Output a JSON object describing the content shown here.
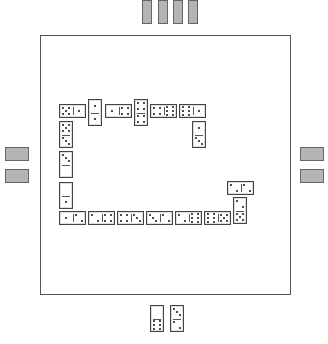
{
  "board": {
    "left": 40,
    "top": 35,
    "width": 251,
    "height": 260
  },
  "opponents": {
    "top": {
      "count": 4,
      "tiles": [
        {
          "x": 142,
          "y": 0
        },
        {
          "x": 158,
          "y": 0
        },
        {
          "x": 173,
          "y": 0
        },
        {
          "x": 188,
          "y": 0
        }
      ],
      "w": 10,
      "h": 24
    },
    "left": {
      "count": 2,
      "tiles": [
        {
          "x": 5,
          "y": 147
        },
        {
          "x": 5,
          "y": 169
        }
      ],
      "w": 24,
      "h": 14
    },
    "right": {
      "count": 2,
      "tiles": [
        {
          "x": 300,
          "y": 147
        },
        {
          "x": 300,
          "y": 169
        }
      ],
      "w": 24,
      "h": 14
    }
  },
  "colors": {
    "hidden_tile": "#b4b4b4",
    "border": "#555555",
    "pip": "#111111"
  },
  "chain": [
    {
      "x": 59,
      "y": 104,
      "w": 27,
      "h": 14,
      "o": "h",
      "a": 5,
      "b": 1
    },
    {
      "x": 88,
      "y": 99,
      "w": 14,
      "h": 27,
      "o": "v",
      "a": 1,
      "b": 1
    },
    {
      "x": 105,
      "y": 104,
      "w": 27,
      "h": 14,
      "o": "h",
      "a": 1,
      "b": 4
    },
    {
      "x": 134,
      "y": 99,
      "w": 14,
      "h": 27,
      "o": "v",
      "a": 4,
      "b": 4
    },
    {
      "x": 150,
      "y": 104,
      "w": 27,
      "h": 14,
      "o": "h",
      "a": 4,
      "b": 6
    },
    {
      "x": 179,
      "y": 104,
      "w": 27,
      "h": 14,
      "o": "h",
      "a": 6,
      "b": 1
    },
    {
      "x": 192,
      "y": 121,
      "w": 14,
      "h": 27,
      "o": "v",
      "a": 1,
      "b": 3
    },
    {
      "x": 59,
      "y": 121,
      "w": 14,
      "h": 27,
      "o": "v",
      "a": 5,
      "b": 3
    },
    {
      "x": 59,
      "y": 151,
      "w": 14,
      "h": 27,
      "o": "v",
      "a": 3,
      "b": 0
    },
    {
      "x": 59,
      "y": 182,
      "w": 14,
      "h": 27,
      "o": "v",
      "a": 0,
      "b": 1
    },
    {
      "x": 59,
      "y": 211,
      "w": 27,
      "h": 14,
      "o": "h",
      "a": 1,
      "b": 2
    },
    {
      "x": 88,
      "y": 211,
      "w": 27,
      "h": 14,
      "o": "h",
      "a": 2,
      "b": 4
    },
    {
      "x": 117,
      "y": 211,
      "w": 27,
      "h": 14,
      "o": "h",
      "a": 4,
      "b": 3
    },
    {
      "x": 146,
      "y": 211,
      "w": 27,
      "h": 14,
      "o": "h",
      "a": 3,
      "b": 2
    },
    {
      "x": 175,
      "y": 211,
      "w": 27,
      "h": 14,
      "o": "h",
      "a": 2,
      "b": 6
    },
    {
      "x": 204,
      "y": 211,
      "w": 27,
      "h": 14,
      "o": "h",
      "a": 6,
      "b": 5
    },
    {
      "x": 233,
      "y": 197,
      "w": 14,
      "h": 27,
      "o": "v",
      "a": 2,
      "b": 5
    },
    {
      "x": 227,
      "y": 181,
      "w": 27,
      "h": 14,
      "o": "h",
      "a": 2,
      "b": 2
    }
  ],
  "hand": [
    {
      "x": 150,
      "y": 305,
      "w": 14,
      "h": 27,
      "o": "v",
      "a": 0,
      "b": 6
    },
    {
      "x": 170,
      "y": 305,
      "w": 14,
      "h": 27,
      "o": "v",
      "a": 3,
      "b": 2
    }
  ]
}
